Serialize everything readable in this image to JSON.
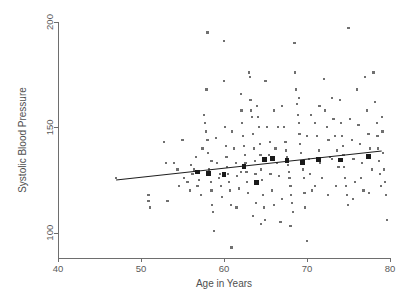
{
  "chart_data": {
    "type": "scatter",
    "title": "",
    "xlabel": "Age in Years",
    "ylabel": "Systolic Blood Pressure",
    "xlim": [
      40,
      80
    ],
    "ylim": [
      88,
      200
    ],
    "xticks": [
      40,
      50,
      60,
      70,
      80
    ],
    "yticks": [
      100,
      150,
      200
    ],
    "xtick_labels": [
      "40",
      "50",
      "60",
      "70",
      "80"
    ],
    "ytick_labels": [
      "100",
      "150",
      "200"
    ],
    "grid": false,
    "legend": null,
    "series": [
      {
        "name": "observations",
        "marker": "small-square",
        "color": "#707070",
        "points": [
          [
            47.0,
            126.0
          ],
          [
            50.9,
            118.0
          ],
          [
            50.9,
            115.0
          ],
          [
            51.1,
            112.0
          ],
          [
            52.8,
            143.0
          ],
          [
            53.0,
            133.0
          ],
          [
            53.2,
            115.0
          ],
          [
            54.0,
            133.0
          ],
          [
            54.4,
            130.0
          ],
          [
            54.6,
            122.0
          ],
          [
            55.0,
            144.0
          ],
          [
            55.2,
            126.0
          ],
          [
            55.6,
            124.0
          ],
          [
            55.9,
            120.0
          ],
          [
            56.0,
            132.0
          ],
          [
            56.2,
            128.0
          ],
          [
            56.4,
            130.0
          ],
          [
            56.6,
            136.0
          ],
          [
            56.8,
            122.0
          ],
          [
            57.0,
            125.0
          ],
          [
            57.2,
            118.0
          ],
          [
            57.4,
            140.0
          ],
          [
            57.6,
            156.0
          ],
          [
            57.7,
            152.0
          ],
          [
            57.8,
            148.0
          ],
          [
            57.9,
            168.0
          ],
          [
            58.0,
            195.0
          ],
          [
            58.0,
            144.0
          ],
          [
            58.1,
            138.0
          ],
          [
            58.2,
            130.0
          ],
          [
            58.3,
            128.0
          ],
          [
            58.4,
            124.0
          ],
          [
            58.5,
            120.0
          ],
          [
            58.6,
            113.0
          ],
          [
            58.7,
            110.0
          ],
          [
            58.8,
            101.0
          ],
          [
            59.0,
            145.0
          ],
          [
            59.2,
            133.0
          ],
          [
            59.4,
            126.0
          ],
          [
            59.6,
            122.0
          ],
          [
            59.8,
            117.0
          ],
          [
            60.0,
            191.0
          ],
          [
            60.0,
            172.0
          ],
          [
            60.1,
            150.0
          ],
          [
            60.2,
            141.0
          ],
          [
            60.3,
            136.0
          ],
          [
            60.4,
            131.0
          ],
          [
            60.5,
            128.0
          ],
          [
            60.6,
            124.0
          ],
          [
            60.7,
            120.0
          ],
          [
            60.8,
            113.0
          ],
          [
            60.9,
            93.0
          ],
          [
            61.0,
            148.0
          ],
          [
            61.2,
            140.0
          ],
          [
            61.4,
            133.0
          ],
          [
            61.6,
            127.0
          ],
          [
            61.8,
            121.0
          ],
          [
            62.0,
            166.0
          ],
          [
            62.1,
            158.0
          ],
          [
            62.2,
            152.0
          ],
          [
            62.3,
            146.0
          ],
          [
            62.4,
            141.0
          ],
          [
            62.5,
            137.0
          ],
          [
            62.6,
            133.0
          ],
          [
            62.7,
            129.0
          ],
          [
            62.8,
            124.0
          ],
          [
            62.9,
            119.0
          ],
          [
            63.0,
            176.0
          ],
          [
            63.1,
            174.0
          ],
          [
            63.2,
            163.0
          ],
          [
            63.3,
            158.0
          ],
          [
            63.4,
            155.0
          ],
          [
            63.5,
            147.0
          ],
          [
            63.6,
            140.0
          ],
          [
            63.7,
            134.0
          ],
          [
            63.8,
            128.0
          ],
          [
            63.9,
            114.0
          ],
          [
            64.0,
            160.0
          ],
          [
            64.1,
            155.0
          ],
          [
            64.2,
            150.0
          ],
          [
            64.3,
            142.0
          ],
          [
            64.4,
            137.0
          ],
          [
            64.5,
            130.0
          ],
          [
            64.6,
            125.0
          ],
          [
            64.7,
            118.0
          ],
          [
            64.8,
            112.0
          ],
          [
            64.9,
            106.0
          ],
          [
            65.0,
            172.0
          ],
          [
            65.2,
            150.0
          ],
          [
            65.4,
            137.0
          ],
          [
            65.6,
            128.0
          ],
          [
            65.8,
            120.0
          ],
          [
            66.0,
            158.0
          ],
          [
            66.2,
            140.0
          ],
          [
            66.4,
            133.0
          ],
          [
            66.6,
            127.0
          ],
          [
            66.8,
            105.0
          ],
          [
            67.0,
            160.0
          ],
          [
            67.2,
            150.0
          ],
          [
            67.4,
            143.0
          ],
          [
            67.5,
            139.0
          ],
          [
            67.6,
            136.0
          ],
          [
            67.7,
            132.0
          ],
          [
            67.8,
            129.0
          ],
          [
            67.9,
            126.0
          ],
          [
            68.0,
            122.0
          ],
          [
            68.1,
            118.0
          ],
          [
            68.2,
            114.0
          ],
          [
            68.3,
            110.0
          ],
          [
            68.5,
            190.0
          ],
          [
            68.6,
            176.0
          ],
          [
            68.7,
            168.0
          ],
          [
            68.8,
            161.0
          ],
          [
            68.9,
            156.0
          ],
          [
            69.0,
            152.0
          ],
          [
            69.1,
            147.0
          ],
          [
            69.2,
            142.0
          ],
          [
            69.3,
            138.0
          ],
          [
            69.4,
            134.0
          ],
          [
            69.5,
            130.0
          ],
          [
            69.6,
            126.0
          ],
          [
            69.7,
            119.0
          ],
          [
            69.8,
            112.0
          ],
          [
            70.0,
            96.0
          ],
          [
            70.2,
            135.0
          ],
          [
            70.4,
            128.0
          ],
          [
            70.6,
            120.0
          ],
          [
            71.0,
            152.0
          ],
          [
            71.2,
            146.0
          ],
          [
            71.4,
            139.0
          ],
          [
            71.6,
            133.0
          ],
          [
            71.8,
            126.0
          ],
          [
            72.0,
            173.0
          ],
          [
            72.2,
            158.0
          ],
          [
            72.4,
            150.0
          ],
          [
            72.6,
            144.0
          ],
          [
            72.8,
            136.0
          ],
          [
            73.0,
            164.0
          ],
          [
            73.2,
            154.0
          ],
          [
            73.4,
            146.0
          ],
          [
            73.6,
            139.0
          ],
          [
            73.8,
            131.0
          ],
          [
            74.0,
            163.0
          ],
          [
            74.1,
            152.0
          ],
          [
            74.2,
            146.0
          ],
          [
            74.3,
            141.0
          ],
          [
            74.4,
            137.0
          ],
          [
            74.5,
            131.0
          ],
          [
            74.6,
            126.0
          ],
          [
            74.7,
            122.0
          ],
          [
            74.8,
            118.0
          ],
          [
            74.9,
            113.0
          ],
          [
            75.0,
            197.0
          ],
          [
            75.2,
            154.0
          ],
          [
            75.4,
            144.0
          ],
          [
            75.6,
            135.0
          ],
          [
            75.8,
            124.0
          ],
          [
            76.0,
            168.0
          ],
          [
            76.2,
            151.0
          ],
          [
            76.4,
            142.0
          ],
          [
            76.6,
            133.0
          ],
          [
            76.8,
            120.0
          ],
          [
            77.0,
            174.0
          ],
          [
            77.2,
            158.0
          ],
          [
            77.4,
            147.0
          ],
          [
            77.6,
            140.0
          ],
          [
            77.8,
            130.0
          ],
          [
            78.0,
            176.0
          ],
          [
            78.2,
            162.0
          ],
          [
            78.4,
            152.0
          ],
          [
            78.5,
            146.0
          ],
          [
            78.6,
            140.0
          ],
          [
            78.7,
            134.0
          ],
          [
            78.8,
            128.0
          ],
          [
            78.9,
            122.0
          ],
          [
            79.0,
            155.0
          ],
          [
            79.1,
            148.0
          ],
          [
            79.2,
            138.0
          ],
          [
            79.3,
            130.0
          ],
          [
            79.4,
            124.0
          ],
          [
            79.5,
            118.0
          ],
          [
            79.6,
            106.0
          ],
          [
            62.0,
            129.0
          ],
          [
            65.5,
            143.0
          ],
          [
            66.5,
            150.0
          ],
          [
            70.5,
            156.0
          ],
          [
            71.5,
            160.0
          ],
          [
            73.5,
            122.0
          ],
          [
            63.5,
            108.0
          ],
          [
            64.5,
            104.0
          ],
          [
            66.0,
            113.0
          ],
          [
            67.0,
            116.0
          ],
          [
            68.0,
            103.0
          ],
          [
            61.5,
            112.0
          ],
          [
            59.5,
            128.0
          ],
          [
            58.5,
            134.0
          ],
          [
            72.5,
            118.0
          ],
          [
            75.5,
            116.0
          ],
          [
            77.5,
            119.0
          ],
          [
            76.5,
            126.0
          ],
          [
            69.0,
            164.0
          ],
          [
            70.0,
            146.0
          ],
          [
            71.0,
            122.0
          ],
          [
            73.0,
            135.0
          ]
        ]
      },
      {
        "name": "binned-means",
        "marker": "large-square",
        "color": "#1a1a1a",
        "points": [
          [
            56.8,
            128.8
          ],
          [
            58.1,
            128.0
          ],
          [
            60.0,
            127.6
          ],
          [
            62.4,
            131.6
          ],
          [
            63.9,
            123.8
          ],
          [
            64.9,
            134.6
          ],
          [
            65.8,
            135.3
          ],
          [
            67.6,
            134.4
          ],
          [
            69.5,
            133.4
          ],
          [
            71.4,
            134.8
          ],
          [
            74.0,
            134.5
          ],
          [
            77.4,
            136.3
          ]
        ]
      }
    ],
    "fit_line": {
      "name": "linear-fit",
      "color": "#1f1f1f",
      "x_start": 47.0,
      "y_start": 125.0,
      "x_end": 79.0,
      "y_end": 138.8
    }
  }
}
